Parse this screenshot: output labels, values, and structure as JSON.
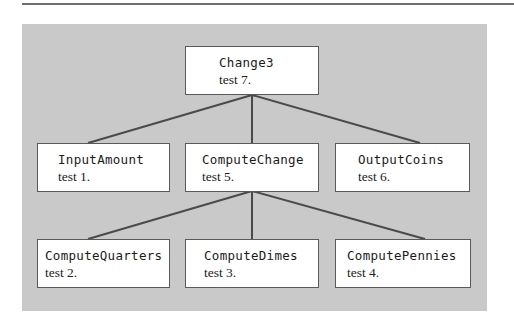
{
  "diagram": {
    "type": "structure-chart",
    "colors": {
      "panel": "#c9c9c9",
      "box": "#ffffff",
      "border": "#5a5a5a",
      "line": "#4a4a4a"
    },
    "root": {
      "name": "Change3",
      "test": "test 7."
    },
    "level1": [
      {
        "name": "InputAmount",
        "test": "test 1."
      },
      {
        "name": "ComputeChange",
        "test": "test 5."
      },
      {
        "name": "OutputCoins",
        "test": "test 6."
      }
    ],
    "level2": [
      {
        "name": "ComputeQuarters",
        "test": "test 2."
      },
      {
        "name": "ComputeDimes",
        "test": "test 3."
      },
      {
        "name": "ComputePennies",
        "test": "test 4."
      }
    ],
    "edges": [
      [
        "Change3",
        "InputAmount"
      ],
      [
        "Change3",
        "ComputeChange"
      ],
      [
        "Change3",
        "OutputCoins"
      ],
      [
        "ComputeChange",
        "ComputeQuarters"
      ],
      [
        "ComputeChange",
        "ComputeDimes"
      ],
      [
        "ComputeChange",
        "ComputePennies"
      ]
    ]
  }
}
